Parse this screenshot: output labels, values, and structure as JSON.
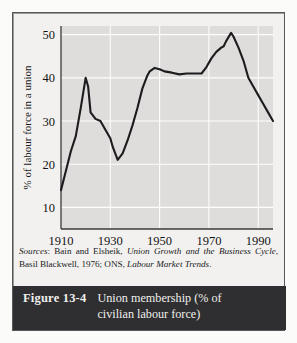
{
  "figure": {
    "number": "Figure 13-4",
    "caption_line1": "Union membership (% of",
    "caption_line2": "civilian labour force)",
    "sources_prefix": "Sources",
    "sources_colon": ": ",
    "sources_part1": "Bain and Elsheik, ",
    "sources_italic1": "Union Growth and the Business Cycle",
    "sources_part2": ", Basil Blackwell, 1976; ONS, ",
    "sources_italic2": "Labour Market Trends",
    "sources_end": "."
  },
  "chart_data": {
    "type": "line",
    "title": "Union membership (% of civilian labour force)",
    "xlabel": "",
    "ylabel": "% of labour force in a union",
    "xlim": [
      1910,
      1996
    ],
    "ylim": [
      5,
      52
    ],
    "xticks": [
      1910,
      1930,
      1950,
      1970,
      1990
    ],
    "yticks": [
      10,
      20,
      30,
      40,
      50
    ],
    "grid": true,
    "legend": null,
    "line_color": "#1c1c1e",
    "plot_background": "#dedddb",
    "series": [
      {
        "name": "% of labour force in a union",
        "x": [
          1910,
          1912,
          1914,
          1916,
          1918,
          1920,
          1921,
          1922,
          1924,
          1926,
          1928,
          1930,
          1931,
          1933,
          1935,
          1937,
          1939,
          1941,
          1943,
          1945,
          1946,
          1948,
          1950,
          1952,
          1955,
          1958,
          1961,
          1964,
          1967,
          1969,
          1971,
          1973,
          1975,
          1976,
          1977,
          1979,
          1980,
          1982,
          1984,
          1986,
          1988,
          1990,
          1992,
          1994,
          1996
        ],
        "values": [
          14.0,
          18.5,
          23.0,
          26.5,
          33.0,
          40.0,
          38.0,
          32.0,
          30.5,
          30.0,
          28.0,
          26.0,
          24.0,
          21.0,
          22.5,
          25.5,
          29.0,
          33.0,
          37.5,
          40.5,
          41.5,
          42.3,
          42.0,
          41.5,
          41.2,
          40.8,
          41.0,
          41.0,
          41.0,
          42.5,
          44.5,
          46.0,
          47.0,
          47.3,
          48.5,
          50.4,
          49.5,
          47.0,
          44.0,
          40.0,
          38.0,
          36.0,
          34.0,
          32.0,
          30.0
        ]
      }
    ]
  }
}
